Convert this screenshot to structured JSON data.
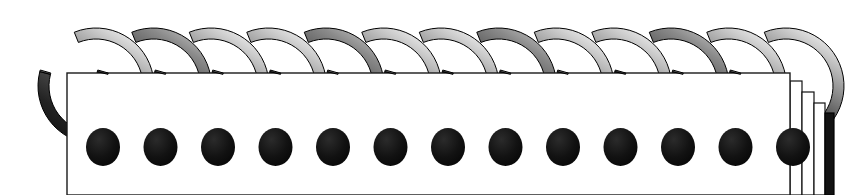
{
  "scene": {
    "title": "Spiral-bound notebook binding",
    "width": 848,
    "height": 195,
    "background_color": "#ffffff",
    "description": "Close-up illustration of a twin-loop wire spiral binding threaded through the top edge of a stack of pages."
  },
  "binding": {
    "name": "spiral-wire-binding",
    "ring_count": 13,
    "first_ring_center_x": 96,
    "ring_spacing_x": 57.5,
    "ring_center_y": 86,
    "ring_outer_radius": 58,
    "ring_thickness": 11,
    "gap_start_deg": -74,
    "gap_sweep_deg": 52,
    "blob": {
      "name": "wire-end-bead",
      "radius_x": 17,
      "radius_y": 19,
      "offset_x": 7,
      "offset_y": 61,
      "color": "#0d0d0d"
    },
    "gradient_stops": [
      {
        "offset": "0%",
        "color": "#f2f2f2"
      },
      {
        "offset": "14%",
        "color": "#c9c9c9"
      },
      {
        "offset": "34%",
        "color": "#8e8e8e"
      },
      {
        "offset": "56%",
        "color": "#4a4a4a"
      },
      {
        "offset": "78%",
        "color": "#232323"
      },
      {
        "offset": "100%",
        "color": "#111111"
      }
    ],
    "outline_color": "#000000",
    "outline_width": 1
  },
  "paper": {
    "name": "page-block",
    "front_page": {
      "x": 67,
      "y": 73,
      "width": 723,
      "height": 122,
      "fill": "#ffffff",
      "stroke": "#1a1a1a",
      "stroke_width": 1.4
    },
    "stack_pages": [
      {
        "label": "sheet-2",
        "x": 790,
        "top": 81,
        "width": 12,
        "fill": "#ffffff",
        "stroke": "#111111"
      },
      {
        "label": "sheet-3",
        "x": 802,
        "top": 92,
        "width": 12,
        "fill": "#ffffff",
        "stroke": "#111111"
      },
      {
        "label": "sheet-4",
        "x": 814,
        "top": 103,
        "width": 11,
        "fill": "#ffffff",
        "stroke": "#111111"
      },
      {
        "label": "back-cover",
        "x": 825,
        "top": 113,
        "width": 9,
        "fill": "#121212",
        "stroke": "#000000"
      }
    ],
    "bottom_y": 195
  },
  "palette": {
    "highlight": "#f2f2f2",
    "midtone": "#8e8e8e",
    "shadow": "#232323",
    "ink": "#000000",
    "paper_white": "#ffffff"
  },
  "labels": {
    "figure_caption": "Spiral-bound notebook binding",
    "alt_text": "Thirteen metallic twin-loop wire rings curving over the top edge of a white page stack, each ring ending in a dark bead below the page line; the right side shows four stepped page edges ending in a black back cover."
  }
}
